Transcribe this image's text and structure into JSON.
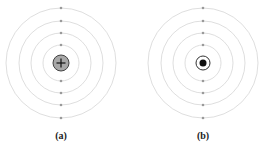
{
  "figure": {
    "panels": [
      {
        "id": "a",
        "label": "(a)",
        "center": [
          61,
          63
        ],
        "nucleus": {
          "type": "positive",
          "symbol": "+",
          "fill": "#a8a8a8",
          "stroke": "#444444",
          "radius": 8
        },
        "orbits": [
          18,
          30,
          42,
          55
        ],
        "electrons_per_orbit": 2
      },
      {
        "id": "b",
        "label": "(b)",
        "center": [
          203,
          63
        ],
        "nucleus": {
          "type": "dot-in-ring",
          "fill": "#111111",
          "ring_stroke": "#333333",
          "ring_radius": 7,
          "dot_radius": 3.5
        },
        "orbits": [
          18,
          30,
          42,
          55
        ],
        "electrons_per_orbit": 2
      }
    ],
    "colors": {
      "orbit": "#d6d6d6",
      "electron": "#9a9a9a"
    }
  }
}
